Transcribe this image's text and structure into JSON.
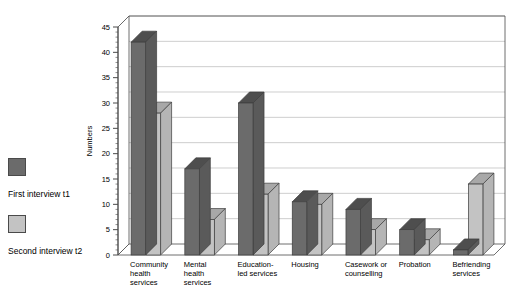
{
  "legend": {
    "entries": [
      {
        "label": "First interview t1",
        "color": "#6b6b6b",
        "swatch_name": "legend-swatch-t1"
      },
      {
        "label": "Second interview t2",
        "color": "#c3c3c3",
        "swatch_name": "legend-swatch-t2"
      }
    ]
  },
  "chart_data": {
    "type": "bar",
    "title": "",
    "subtitle": "",
    "xlabel": "",
    "ylabel": "Numbers",
    "ylim": [
      0,
      45
    ],
    "ytick_step": 5,
    "yticks": [
      0,
      5,
      10,
      15,
      20,
      25,
      30,
      35,
      40,
      45
    ],
    "ytick_labels": [
      "0",
      "5",
      "10",
      "15",
      "20",
      "25",
      "30",
      "35",
      "40",
      "45"
    ],
    "grid": true,
    "grid_axis": "y",
    "legend_position": "left",
    "style": "3d-column",
    "categories": [
      "Community health services",
      "Mental health services",
      "Education-led services",
      "Housing",
      "Casework or counselling",
      "Probation",
      "Befriending services"
    ],
    "category_lines": [
      [
        "Community",
        "health",
        "services"
      ],
      [
        "Mental",
        "health",
        "services"
      ],
      [
        "Education-",
        "led services"
      ],
      [
        "Housing"
      ],
      [
        "Casework or",
        "counselling"
      ],
      [
        "Probation"
      ],
      [
        "Befriending",
        "services"
      ]
    ],
    "series": [
      {
        "name": "First interview t1",
        "color": "#6b6b6b",
        "values": [
          42,
          17,
          30,
          10.5,
          9,
          5,
          1
        ]
      },
      {
        "name": "Second interview t2",
        "color": "#c3c3c3",
        "values": [
          28,
          7,
          12,
          10,
          5,
          3,
          14
        ]
      }
    ]
  },
  "colors": {
    "series_t1_front": "#6b6b6b",
    "series_t1_top": "#4e4e4e",
    "series_t1_side": "#5a5a5a",
    "series_t2_front": "#c3c3c3",
    "series_t2_top": "#a8a8a8",
    "series_t2_side": "#b5b5b5",
    "plot_background": "#ffffff",
    "grid_line": "#b9b9b9",
    "axis_line": "#4a4a4a"
  }
}
